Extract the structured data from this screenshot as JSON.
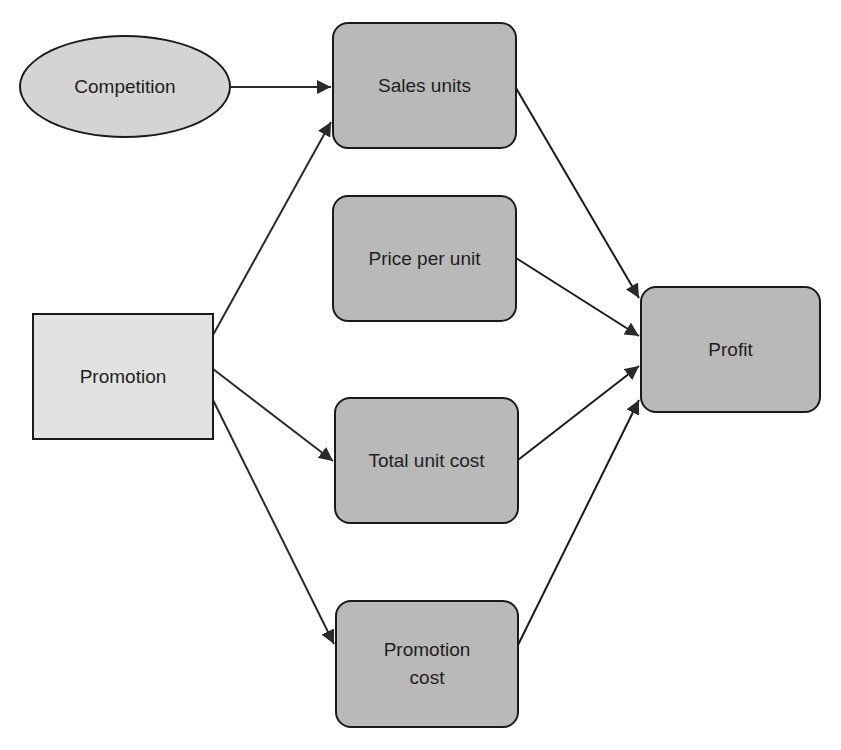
{
  "diagram": {
    "type": "influence-diagram",
    "nodes": [
      {
        "id": "competition",
        "label": "Competition",
        "shape": "ellipse"
      },
      {
        "id": "promotion",
        "label": "Promotion",
        "shape": "rectangle"
      },
      {
        "id": "sales_units",
        "label": "Sales units",
        "shape": "rounded-rectangle"
      },
      {
        "id": "price_per_unit",
        "label": "Price per unit",
        "shape": "rounded-rectangle"
      },
      {
        "id": "total_unit_cost",
        "label": "Total unit cost",
        "shape": "rounded-rectangle"
      },
      {
        "id": "promotion_cost",
        "label": "Promotion\ncost",
        "shape": "rounded-rectangle"
      },
      {
        "id": "profit",
        "label": "Profit",
        "shape": "rounded-rectangle"
      }
    ],
    "edges": [
      {
        "from": "competition",
        "to": "sales_units"
      },
      {
        "from": "promotion",
        "to": "sales_units"
      },
      {
        "from": "promotion",
        "to": "total_unit_cost"
      },
      {
        "from": "promotion",
        "to": "promotion_cost"
      },
      {
        "from": "sales_units",
        "to": "profit"
      },
      {
        "from": "price_per_unit",
        "to": "profit"
      },
      {
        "from": "total_unit_cost",
        "to": "profit"
      },
      {
        "from": "promotion_cost",
        "to": "profit"
      }
    ],
    "colors": {
      "ellipse_fill": "#d4d4d4",
      "rect_fill": "#e2e2e2",
      "rounded_fill": "#b9b9b9",
      "stroke": "#1a1a1a"
    }
  }
}
